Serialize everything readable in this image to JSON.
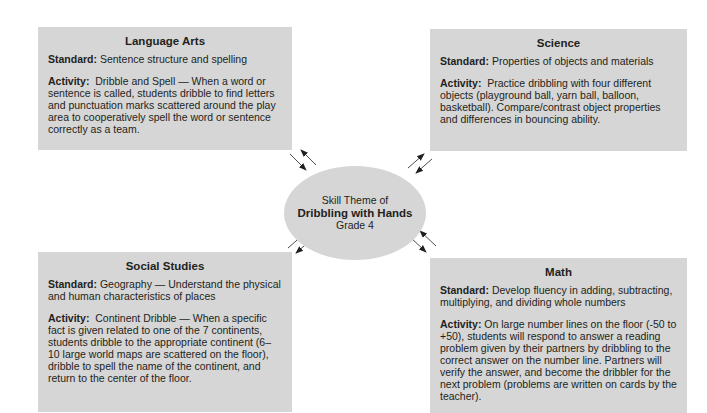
{
  "center": {
    "line1": "Skill Theme of",
    "line2": "Dribbling with Hands",
    "line3": "Grade 4"
  },
  "boxes": {
    "language_arts": {
      "title": "Language Arts",
      "standard_label": "Standard:",
      "standard": "Sentence structure and spelling",
      "activity_label": "Activity:",
      "activity": "Dribble and Spell — When a word or sentence is called, students dribble to find letters and punctuation marks scattered around the play area to cooperatively spell the word or sentence correctly as a team."
    },
    "science": {
      "title": "Science",
      "standard_label": "Standard:",
      "standard": "Properties of objects and materials",
      "activity_label": "Activity:",
      "activity": "Practice dribbling with four different objects (playground ball, yarn ball, balloon, basketball).  Compare/contrast object properties and differences in bouncing ability."
    },
    "social_studies": {
      "title": "Social Studies",
      "standard_label": "Standard:",
      "standard": "Geography — Understand the physical and human characteristics of places",
      "activity_label": "Activity:",
      "activity": "Continent Dribble — When a specific fact is given related to one of the 7 continents, students dribble to the appropriate continent (6–10 large world maps are scattered on the floor), dribble to spell the name of the continent, and return to the center of the floor."
    },
    "math": {
      "title": "Math",
      "standard_label": "Standard:",
      "standard": "Develop fluency in adding, subtracting, multiplying, and dividing whole numbers",
      "activity_label": "Activity:",
      "activity": "On large number lines on the floor (-50 to +50), students will respond to answer a reading problem given by their partners by dribbling to the correct answer on the number line.  Partners will verify the answer, and become the dribbler for the next problem (problems are written on cards by the teacher)."
    }
  },
  "colors": {
    "box_fill": "#d6d6d6",
    "text": "#231f20",
    "background": "#ffffff"
  }
}
